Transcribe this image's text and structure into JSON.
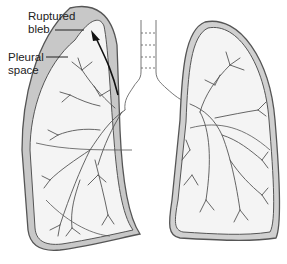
{
  "diagram": {
    "labels": {
      "ruptured_bleb_line1": "Ruptured",
      "ruptured_bleb_line2": "bleb",
      "pleural_space_line1": "Pleural",
      "pleural_space_line2": "space"
    },
    "colors": {
      "pleural_fill": "#c8c8c8",
      "lung_fill": "#f4f4f4",
      "outline": "#555555",
      "background": "#ffffff"
    }
  }
}
